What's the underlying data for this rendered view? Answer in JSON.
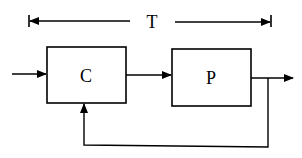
{
  "diagram": {
    "type": "block-diagram",
    "span_label": "T",
    "blocks": [
      {
        "id": "controller",
        "label": "C"
      },
      {
        "id": "plant",
        "label": "P"
      }
    ],
    "connections": [
      {
        "from": "input",
        "to": "controller"
      },
      {
        "from": "controller",
        "to": "plant"
      },
      {
        "from": "plant",
        "to": "output"
      },
      {
        "from": "plant-output",
        "to": "controller",
        "kind": "feedback"
      }
    ],
    "colors": {
      "stroke": "#000000",
      "background": "#ffffff"
    }
  }
}
